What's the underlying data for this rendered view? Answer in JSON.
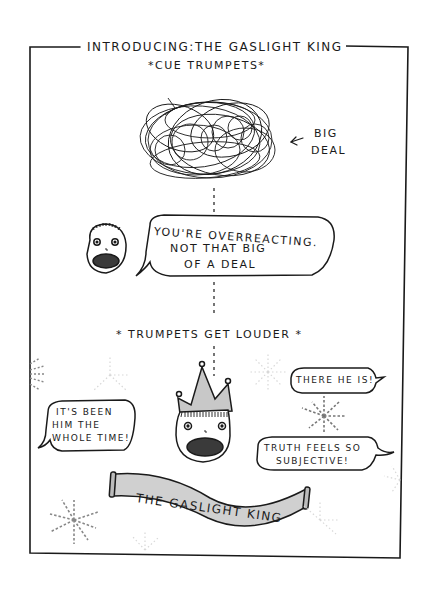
{
  "comic": {
    "title": "INTRODUCING:THE GASLIGHT KING",
    "subtitle": "*CUE TRUMPETS*",
    "big_deal_label": [
      "BIG",
      "DEAL"
    ],
    "speech_overreacting": [
      "YOU'RE OVERREACTING.",
      "NOT THAT BIG",
      "OF A DEAL"
    ],
    "caption_louder": "* TRUMPETS GET LOUDER *",
    "speech_left": [
      "IT'S BEEN",
      "HIM THE",
      "WHOLE TIME!"
    ],
    "speech_there": "THERE HE IS!",
    "speech_truth": [
      "TRUTH FEELS SO",
      "SUBJECTIVE!"
    ],
    "banner_text": "THE GASLIGHT KING"
  },
  "colors": {
    "ink": "#1a1a1a",
    "crown_fill": "#c8c8c8",
    "banner_fill": "#d0d0d0",
    "mouth_fill": "#3a3a3a",
    "firework_gray": "#8a8a8a",
    "firework_faint": "#d8d8d8",
    "paper": "#ffffff"
  }
}
